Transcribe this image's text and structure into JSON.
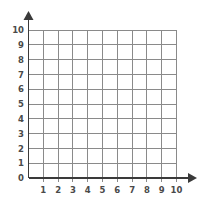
{
  "figure": {
    "name": "coordinate-grid"
  },
  "chart_data": {
    "type": "scatter",
    "title": "",
    "subtitle": "",
    "xlabel": "",
    "ylabel": "",
    "xlim": [
      0,
      10
    ],
    "ylim": [
      0,
      10
    ],
    "grid": true,
    "legend": null,
    "series": [],
    "x": [],
    "values": [],
    "x_ticks": [
      0,
      1,
      2,
      3,
      4,
      5,
      6,
      7,
      8,
      9,
      10
    ],
    "y_ticks": [
      0,
      1,
      2,
      3,
      4,
      5,
      6,
      7,
      8,
      9,
      10
    ],
    "x_tick_labels": [
      "",
      "1",
      "2",
      "3",
      "4",
      "5",
      "6",
      "7",
      "8",
      "9",
      "10"
    ],
    "y_tick_labels": [
      "0",
      "1",
      "2",
      "3",
      "4",
      "5",
      "6",
      "7",
      "8",
      "9",
      "10"
    ],
    "origin_label": "0",
    "x_axis_arrow": true,
    "y_axis_arrow": true,
    "annotations": []
  },
  "axes": {
    "x": {
      "name": "x-axis",
      "ticks": [
        {
          "value": 1,
          "label": "1"
        },
        {
          "value": 2,
          "label": "2"
        },
        {
          "value": 3,
          "label": "3"
        },
        {
          "value": 4,
          "label": "4"
        },
        {
          "value": 5,
          "label": "5"
        },
        {
          "value": 6,
          "label": "6"
        },
        {
          "value": 7,
          "label": "7"
        },
        {
          "value": 8,
          "label": "8"
        },
        {
          "value": 9,
          "label": "9"
        },
        {
          "value": 10,
          "label": "10"
        }
      ]
    },
    "y": {
      "name": "y-axis",
      "ticks": [
        {
          "value": 0,
          "label": "0"
        },
        {
          "value": 1,
          "label": "1"
        },
        {
          "value": 2,
          "label": "2"
        },
        {
          "value": 3,
          "label": "3"
        },
        {
          "value": 4,
          "label": "4"
        },
        {
          "value": 5,
          "label": "5"
        },
        {
          "value": 6,
          "label": "6"
        },
        {
          "value": 7,
          "label": "7"
        },
        {
          "value": 8,
          "label": "8"
        },
        {
          "value": 9,
          "label": "9"
        },
        {
          "value": 10,
          "label": "10"
        }
      ]
    }
  },
  "colors": {
    "background": "#ffffff",
    "grid": "#8a8a8a",
    "axis": "#3a3a3a",
    "tick_label": "#4a4a4a"
  }
}
